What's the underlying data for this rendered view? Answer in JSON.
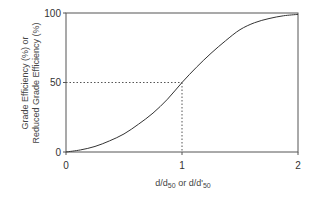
{
  "chart_data": {
    "type": "line",
    "title": "",
    "xlabel": "d/d50 or d/d'50",
    "xlabel_parts": {
      "a": "d/d",
      "a_sub": "50",
      "b": " or d/d'",
      "b_sub": "50"
    },
    "ylabel_line1": "Grade Efficiency (%) or",
    "ylabel_line2": "Reduced Grade Efficiency (%)",
    "xlim": [
      0,
      2
    ],
    "ylim": [
      0,
      100
    ],
    "x_ticks": [
      "0",
      "1",
      "2"
    ],
    "y_ticks": [
      "0",
      "50",
      "100"
    ],
    "grid": false,
    "series": [
      {
        "name": "Grade efficiency curve",
        "x": [
          0,
          0.125,
          0.25,
          0.375,
          0.5,
          0.625,
          0.75,
          0.875,
          1.0,
          1.125,
          1.25,
          1.375,
          1.5,
          1.625,
          1.75,
          1.875,
          2.0
        ],
        "y": [
          0,
          1.5,
          4,
          8,
          13,
          20,
          28,
          38,
          50,
          61,
          71,
          80,
          88,
          93,
          96,
          98,
          99
        ]
      }
    ],
    "annotations": [
      {
        "type": "dotted-guide",
        "x": 1,
        "y": 50,
        "note": "d50 cut point at 50% efficiency"
      }
    ]
  }
}
